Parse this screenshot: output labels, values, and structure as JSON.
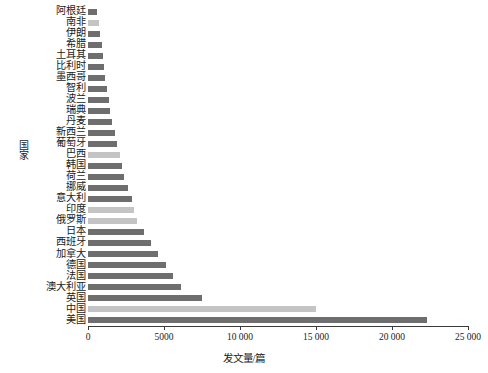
{
  "chart_data": {
    "type": "bar",
    "orientation": "horizontal",
    "title": "",
    "xlabel": "发文量/篇",
    "ylabel": "国家",
    "xlim": [
      0,
      25000
    ],
    "grid": false,
    "legend": "none",
    "xticks": [
      0,
      5000,
      10000,
      15000,
      20000,
      25000
    ],
    "xtick_labels": [
      "0",
      "5000",
      "10 000",
      "15 000",
      "20 000",
      "25 000"
    ],
    "colors": {
      "bar_dark": "#6e6e6e",
      "bar_light": "#c4c4c4",
      "axis": "#3a3a3a",
      "text": "#1a1a1a",
      "background": "#ffffff"
    },
    "categories": [
      "阿根廷",
      "南非",
      "伊朗",
      "希腊",
      "土耳其",
      "比利时",
      "墨西哥",
      "智利",
      "波兰",
      "瑞典",
      "丹麦",
      "新西兰",
      "葡萄牙",
      "巴西",
      "韩国",
      "荷兰",
      "挪威",
      "意大利",
      "印度",
      "俄罗斯",
      "日本",
      "西班牙",
      "加拿大",
      "德国",
      "法国",
      "澳大利亚",
      "英国",
      "中国",
      "美国"
    ],
    "values": [
      600,
      720,
      800,
      920,
      1000,
      1080,
      1150,
      1250,
      1350,
      1450,
      1550,
      1750,
      1900,
      2100,
      2250,
      2400,
      2600,
      2900,
      3050,
      3200,
      3700,
      4150,
      4600,
      5100,
      5600,
      6150,
      7500,
      15000,
      22300
    ],
    "shades": [
      "dark",
      "light",
      "dark",
      "dark",
      "dark",
      "dark",
      "dark",
      "dark",
      "dark",
      "dark",
      "dark",
      "dark",
      "dark",
      "light",
      "dark",
      "dark",
      "dark",
      "dark",
      "light",
      "light",
      "dark",
      "dark",
      "dark",
      "dark",
      "dark",
      "dark",
      "dark",
      "light",
      "dark"
    ]
  }
}
